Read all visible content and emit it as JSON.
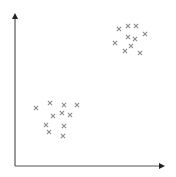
{
  "chart_data": {
    "type": "scatter",
    "title": "",
    "xlabel": "",
    "ylabel": "",
    "grid": false,
    "legend": null,
    "marker": "x",
    "axes": {
      "origin": [
        15,
        166
      ],
      "x_end": 165,
      "y_end": 13,
      "color": "#555555",
      "arrowheads": true,
      "ticks": false
    },
    "point_color": "#8a8a8a",
    "series": [
      {
        "name": "cluster-upper-right",
        "points": [
          {
            "x": 119,
            "y": 29
          },
          {
            "x": 128,
            "y": 26
          },
          {
            "x": 136,
            "y": 26
          },
          {
            "x": 145,
            "y": 34
          },
          {
            "x": 128,
            "y": 37
          },
          {
            "x": 135,
            "y": 39
          },
          {
            "x": 115,
            "y": 43
          },
          {
            "x": 131,
            "y": 46
          },
          {
            "x": 125,
            "y": 51
          },
          {
            "x": 140,
            "y": 53
          }
        ]
      },
      {
        "name": "cluster-lower-left",
        "points": [
          {
            "x": 36,
            "y": 108
          },
          {
            "x": 50,
            "y": 103
          },
          {
            "x": 64,
            "y": 105
          },
          {
            "x": 77,
            "y": 105
          },
          {
            "x": 53,
            "y": 116
          },
          {
            "x": 62,
            "y": 113
          },
          {
            "x": 70,
            "y": 115
          },
          {
            "x": 46,
            "y": 125
          },
          {
            "x": 64,
            "y": 126
          },
          {
            "x": 49,
            "y": 132
          },
          {
            "x": 63,
            "y": 136
          }
        ]
      }
    ]
  }
}
